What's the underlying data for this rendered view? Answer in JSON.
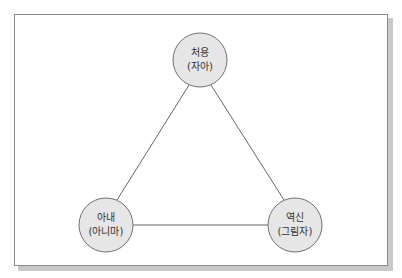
{
  "diagram": {
    "type": "triangle-relationship",
    "nodes": [
      {
        "id": "top",
        "title": "처용",
        "subtitle": "(자아)",
        "cx": 200,
        "cy": 60
      },
      {
        "id": "bottom-left",
        "title": "아내",
        "subtitle": "(아니마)",
        "cx": 106,
        "cy": 225
      },
      {
        "id": "bottom-right",
        "title": "역신",
        "subtitle": "(그림자)",
        "cx": 295,
        "cy": 225
      }
    ],
    "edges": [
      {
        "from": "top",
        "to": "bottom-left"
      },
      {
        "from": "top",
        "to": "bottom-right"
      },
      {
        "from": "bottom-left",
        "to": "bottom-right"
      }
    ],
    "colors": {
      "node_fill": "#e6e6e6",
      "node_stroke": "#707070",
      "edge": "#555555",
      "frame_border": "#8a8a8a",
      "shadow": "#c8c8c8"
    }
  }
}
